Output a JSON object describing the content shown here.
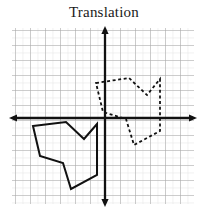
{
  "title": "Translation",
  "figure": {
    "width": 208,
    "height": 215,
    "background": "#ffffff",
    "caption": "Translation"
  },
  "chart_data": {
    "type": "scatter",
    "title": "Translation",
    "subtitle": "",
    "xlabel": "",
    "ylabel": "",
    "grid": true,
    "legend": false,
    "legend_position": "none",
    "axes": {
      "origin_px": [
        105,
        118
      ],
      "cell_px": 7.5,
      "xlim_cells": [
        -12.4,
        12.1
      ],
      "ylim_cells": [
        -11.5,
        12.0
      ],
      "x_axis_pixels": {
        "from": [
          10,
          118
        ],
        "to": [
          196,
          118
        ]
      },
      "y_axis_pixels": {
        "from": [
          105,
          27
        ],
        "to": [
          105,
          206
        ]
      },
      "arrows": [
        "left",
        "right",
        "up",
        "down"
      ],
      "tick_labels": [],
      "axis_color": "#111111",
      "minor_grid_color": "#d8d8d8",
      "major_grid_color": "#a8a8a8",
      "major_every_cells": 2
    },
    "grid_extent_px": {
      "left": 12,
      "top": 28,
      "right": 194,
      "bottom": 204
    },
    "series": [
      {
        "name": "pre-image",
        "style": "solid",
        "color": "#111111",
        "line_width": 2.0,
        "closed": true,
        "quadrant": "III",
        "points_px": [
          [
            33,
            126
          ],
          [
            66,
            122
          ],
          [
            84,
            139
          ],
          [
            97,
            124
          ],
          [
            97,
            175
          ],
          [
            71,
            189
          ],
          [
            63,
            163
          ],
          [
            40,
            156
          ]
        ],
        "points_cells": [
          [
            -9.6,
            -1.1
          ],
          [
            -5.2,
            -0.5
          ],
          [
            -2.8,
            -2.8
          ],
          [
            -1.1,
            -0.8
          ],
          [
            -1.1,
            -7.6
          ],
          [
            -4.5,
            -9.5
          ],
          [
            -5.6,
            -6.0
          ],
          [
            -8.7,
            -5.1
          ]
        ]
      },
      {
        "name": "image",
        "style": "dashed",
        "color": "#111111",
        "line_width": 1.8,
        "dash_pattern": [
          3,
          2.6
        ],
        "closed": true,
        "quadrant": "I",
        "points_px": [
          [
            96,
            83
          ],
          [
            129,
            78
          ],
          [
            147,
            95
          ],
          [
            160,
            79
          ],
          [
            160,
            131
          ],
          [
            134,
            145
          ],
          [
            126,
            119
          ],
          [
            103,
            112
          ]
        ],
        "points_cells": [
          [
            -1.2,
            4.7
          ],
          [
            3.2,
            5.3
          ],
          [
            5.6,
            3.1
          ],
          [
            7.3,
            5.2
          ],
          [
            7.3,
            -1.7
          ],
          [
            3.9,
            -3.6
          ],
          [
            2.8,
            -0.1
          ],
          [
            -0.3,
            0.8
          ]
        ]
      }
    ],
    "translation_vector_cells": [
      8.4,
      5.8
    ],
    "translation_vector_px": [
      63,
      -43
    ],
    "annotations": []
  }
}
